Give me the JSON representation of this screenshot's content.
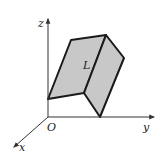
{
  "diagram": {
    "type": "3d-surface-in-coordinate-axes",
    "axes": {
      "origin_label": "O",
      "x_label": "x",
      "y_label": "y",
      "z_label": "z"
    },
    "surface": {
      "label": "L",
      "fill_color": "#c8c8c8",
      "stroke_color": "#1a1a1a",
      "faces": [
        {
          "name": "left-face",
          "points": "48,99 71,40 106,35 84,93"
        },
        {
          "name": "right-face",
          "points": "106,35 124,58 100,117 84,93"
        }
      ]
    },
    "colors": {
      "axis": "#333333",
      "background": "#ffffff"
    }
  }
}
